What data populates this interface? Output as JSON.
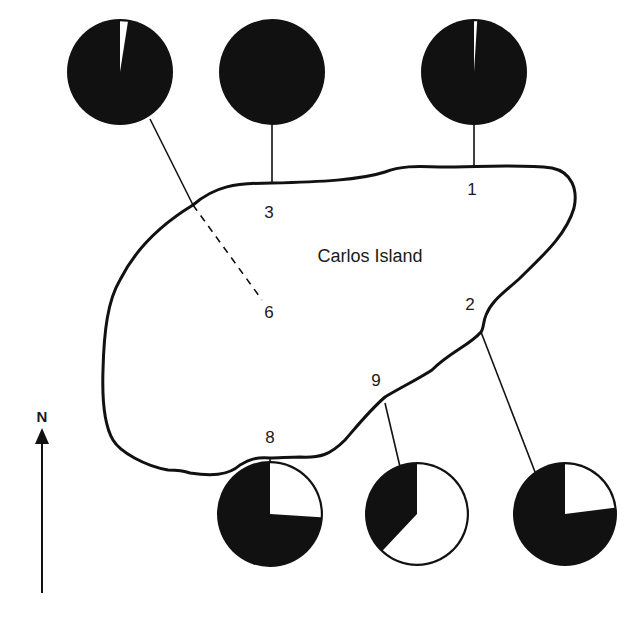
{
  "map": {
    "island_name": "Carlos Island",
    "north_label": "N",
    "colors": {
      "ink": "#111111",
      "paper": "#ffffff"
    }
  },
  "stations": [
    {
      "id": "6",
      "label": "6",
      "label_pos": [
        269,
        312
      ],
      "pie_center": [
        120,
        72
      ],
      "pie_radius": 53,
      "black_fraction": 0.975,
      "white_fraction": 0.025,
      "white_start_deg": 0,
      "connector": "dashed-inland"
    },
    {
      "id": "3",
      "label": "3",
      "label_pos": [
        269,
        212
      ],
      "pie_center": [
        272,
        72
      ],
      "pie_radius": 53,
      "black_fraction": 1.0,
      "white_fraction": 0.0,
      "white_start_deg": 0,
      "connector": "straight"
    },
    {
      "id": "1",
      "label": "1",
      "label_pos": [
        472,
        192
      ],
      "pie_center": [
        474,
        72
      ],
      "pie_radius": 53,
      "black_fraction": 0.99,
      "white_fraction": 0.01,
      "white_start_deg": 0,
      "connector": "straight"
    },
    {
      "id": "2",
      "label": "2",
      "label_pos": [
        470,
        305
      ],
      "pie_center": [
        565,
        514
      ],
      "pie_radius": 52,
      "black_fraction": 0.77,
      "white_fraction": 0.23,
      "white_start_deg": 0,
      "connector": "straight"
    },
    {
      "id": "9",
      "label": "9",
      "label_pos": [
        376,
        380
      ],
      "pie_center": [
        417,
        514
      ],
      "pie_radius": 52,
      "black_fraction": 0.38,
      "white_fraction": 0.62,
      "white_start_deg": 0,
      "connector": "straight"
    },
    {
      "id": "8",
      "label": "8",
      "label_pos": [
        270,
        437
      ],
      "pie_center": [
        270,
        514
      ],
      "pie_radius": 53,
      "black_fraction": 0.74,
      "white_fraction": 0.26,
      "white_start_deg": 0,
      "connector": "straight"
    }
  ],
  "chart_data": {
    "type": "pie",
    "title": "Carlos Island",
    "legend": [],
    "series": [
      {
        "name": "Station 6",
        "values": [
          97.5,
          2.5
        ],
        "categories": [
          "black",
          "white"
        ]
      },
      {
        "name": "Station 3",
        "values": [
          100,
          0
        ],
        "categories": [
          "black",
          "white"
        ]
      },
      {
        "name": "Station 1",
        "values": [
          99,
          1
        ],
        "categories": [
          "black",
          "white"
        ]
      },
      {
        "name": "Station 8",
        "values": [
          74,
          26
        ],
        "categories": [
          "black",
          "white"
        ]
      },
      {
        "name": "Station 9",
        "values": [
          38,
          62
        ],
        "categories": [
          "black",
          "white"
        ]
      },
      {
        "name": "Station 2",
        "values": [
          77,
          23
        ],
        "categories": [
          "black",
          "white"
        ]
      }
    ],
    "annotations": [
      "Carlos Island",
      "N",
      "1",
      "2",
      "3",
      "6",
      "8",
      "9"
    ]
  }
}
